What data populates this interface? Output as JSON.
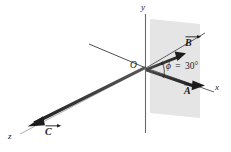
{
  "figure": {
    "title": "",
    "background_color": "#ffffff",
    "ink_color": "#2b2b2b",
    "plane_fill_color": "#e3e3e3",
    "axes": [
      {
        "name": "y",
        "label": "y"
      },
      {
        "name": "x",
        "label": "x"
      },
      {
        "name": "z",
        "label": "z"
      }
    ],
    "origin": {
      "label": "O"
    },
    "vectors": [
      {
        "name": "A",
        "label": "A",
        "description": "vector along positive x axis"
      },
      {
        "name": "B",
        "label": "B",
        "description": "vector in xy-plane above x axis"
      },
      {
        "name": "C",
        "label": "C",
        "description": "vector along positive z axis toward viewer"
      }
    ],
    "angle": {
      "symbol": "ϕ",
      "equals": "=",
      "value": "30°",
      "full_label": "ϕ = 30°"
    },
    "plane": {
      "name": "xy-plane-shading"
    }
  }
}
